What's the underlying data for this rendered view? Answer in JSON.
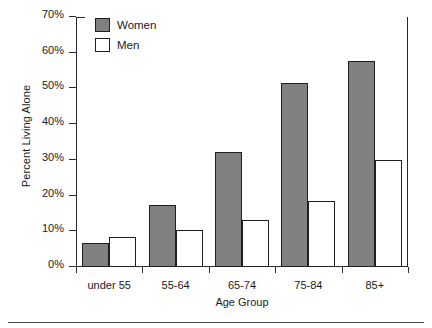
{
  "chart_data": {
    "type": "bar",
    "title": "",
    "xlabel": "Age Group",
    "ylabel": "Percent Living Alone",
    "categories": [
      "under 55",
      "55-64",
      "65-74",
      "75-84",
      "85+"
    ],
    "series": [
      {
        "name": "Women",
        "color": "#808080",
        "values": [
          6.7,
          17.4,
          32.3,
          51.4,
          57.8
        ]
      },
      {
        "name": "Men",
        "color": "#ffffff",
        "values": [
          8.5,
          10.4,
          13.2,
          18.4,
          30.0
        ]
      }
    ],
    "ylim": [
      0,
      70
    ],
    "yticks": [
      0,
      10,
      20,
      30,
      40,
      50,
      60,
      70
    ],
    "ytick_labels": [
      "0%",
      "10%",
      "20%",
      "30%",
      "40%",
      "50%",
      "60%",
      "70%"
    ],
    "grid": false,
    "legend_position": "top-left",
    "legend_entries": [
      "Women",
      "Men"
    ]
  }
}
